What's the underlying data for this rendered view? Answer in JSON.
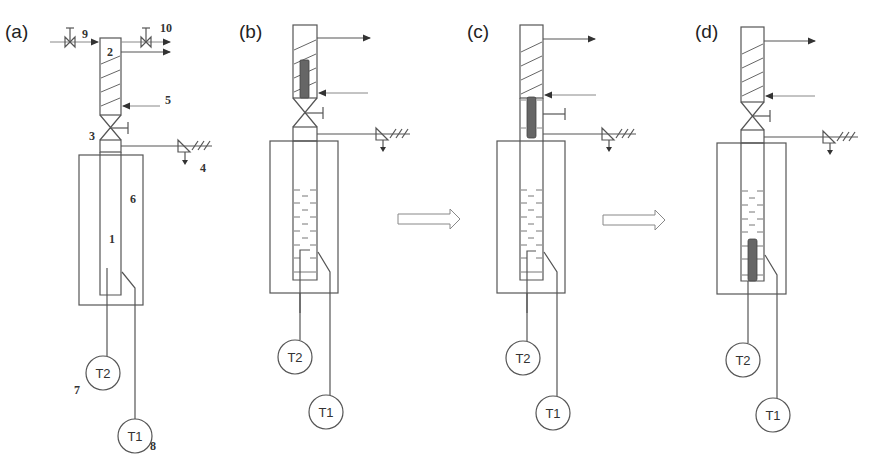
{
  "figure": {
    "panels": [
      {
        "id": "a",
        "label": "(a)",
        "component_numbers": {
          "inner_tube": "1",
          "hatched_column": "2",
          "ball_valve": "3",
          "ground_vent": "4",
          "inlet_arrow": "5",
          "outer_jacket": "6",
          "sensor_T2": "7",
          "sensor_T1": "8",
          "inlet_valve": "9",
          "outlet_valve": "10"
        },
        "sensors": [
          "T2",
          "T1"
        ],
        "state": "schematic"
      },
      {
        "id": "b",
        "label": "(b)",
        "sensors": [
          "T2",
          "T1"
        ],
        "state": "sample in upper column, liquid in tube"
      },
      {
        "id": "c",
        "label": "(c)",
        "sensors": [
          "T2",
          "T1"
        ],
        "state": "sample passing through open valve"
      },
      {
        "id": "d",
        "label": "(d)",
        "sensors": [
          "T2",
          "T1"
        ],
        "state": "sample immersed at tube bottom"
      }
    ],
    "transition_arrows": [
      "b-to-c",
      "c-to-d"
    ],
    "colors": {
      "line": "#555555",
      "sample": "#666666",
      "background": "#ffffff"
    }
  }
}
